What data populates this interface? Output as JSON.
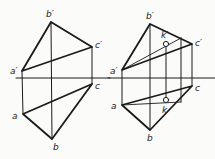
{
  "diagram": {
    "type": "orthographic-projection",
    "colors": {
      "line": "#1a1a1a",
      "thin_line": "#333333",
      "background": "#fbfbfa"
    },
    "figures": [
      {
        "id": "left",
        "axis": {
          "x1": 16,
          "x2": 110,
          "y": 78
        },
        "points": {
          "a_prime": {
            "label": "a′",
            "x": 22,
            "y": 71
          },
          "b_prime": {
            "label": "b′",
            "x": 51,
            "y": 22
          },
          "c_prime": {
            "label": "c′",
            "x": 92,
            "y": 47
          },
          "a": {
            "label": "a",
            "x": 23,
            "y": 114
          },
          "b": {
            "label": "b",
            "x": 52,
            "y": 139
          },
          "c": {
            "label": "c",
            "x": 92,
            "y": 84
          }
        }
      },
      {
        "id": "right",
        "axis": {
          "x1": 108,
          "x2": 215,
          "y": 78
        },
        "points": {
          "a_prime": {
            "label": "a′",
            "x": 122,
            "y": 70
          },
          "b_prime": {
            "label": "b′",
            "x": 150,
            "y": 24
          },
          "c_prime": {
            "label": "c′",
            "x": 192,
            "y": 44
          },
          "a": {
            "label": "a",
            "x": 122,
            "y": 105
          },
          "b": {
            "label": "b",
            "x": 150,
            "y": 130
          },
          "c": {
            "label": "c",
            "x": 192,
            "y": 86
          },
          "k_prime": {
            "label": "k′",
            "x": 166,
            "y": 44
          },
          "k": {
            "label": "k",
            "x": 166,
            "y": 100
          }
        },
        "auxiliary": {
          "top_point": {
            "x": 181,
            "y": 38
          },
          "bottom_point": {
            "x": 181,
            "y": 102
          }
        }
      }
    ],
    "labels": {
      "left_a_prime": "a′",
      "left_b_prime": "b′",
      "left_c_prime": "c′",
      "left_a": "a",
      "left_b": "b",
      "left_c": "c",
      "right_a_prime": "a′",
      "right_b_prime": "b′",
      "right_c_prime": "c′",
      "right_a": "a",
      "right_b": "b",
      "right_c": "c",
      "right_k_prime": "k′",
      "right_k": "k"
    }
  }
}
